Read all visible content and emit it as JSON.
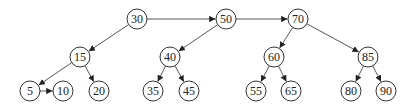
{
  "diagram": {
    "type": "skip-list-tree",
    "colors": {
      "stroke": "#333333",
      "fill": "#ffffff",
      "text": "#222222"
    },
    "node_radius": 10,
    "nodes": [
      {
        "id": "n30",
        "label": "30",
        "x": 137,
        "y": 19
      },
      {
        "id": "n50",
        "label": "50",
        "x": 226,
        "y": 19
      },
      {
        "id": "n70",
        "label": "70",
        "x": 298,
        "y": 19
      },
      {
        "id": "n15",
        "label": "15",
        "x": 80,
        "y": 57
      },
      {
        "id": "n40",
        "label": "40",
        "x": 170,
        "y": 57
      },
      {
        "id": "n60",
        "label": "60",
        "x": 274,
        "y": 57
      },
      {
        "id": "n85",
        "label": "85",
        "x": 368,
        "y": 57
      },
      {
        "id": "n5",
        "label": "5",
        "x": 30,
        "y": 91
      },
      {
        "id": "n10",
        "label": "10",
        "x": 63,
        "y": 91
      },
      {
        "id": "n20",
        "label": "20",
        "x": 99,
        "y": 91
      },
      {
        "id": "n35",
        "label": "35",
        "x": 153,
        "y": 91
      },
      {
        "id": "n45",
        "label": "45",
        "x": 189,
        "y": 91
      },
      {
        "id": "n55",
        "label": "55",
        "x": 256,
        "y": 91
      },
      {
        "id": "n65",
        "label": "65",
        "x": 291,
        "y": 91
      },
      {
        "id": "n80",
        "label": "80",
        "x": 351,
        "y": 91
      },
      {
        "id": "n90",
        "label": "90",
        "x": 386,
        "y": 91
      }
    ],
    "edges": [
      {
        "from": "n30",
        "to": "n50"
      },
      {
        "from": "n50",
        "to": "n70"
      },
      {
        "from": "n30",
        "to": "n15"
      },
      {
        "from": "n50",
        "to": "n40"
      },
      {
        "from": "n70",
        "to": "n60"
      },
      {
        "from": "n70",
        "to": "n85"
      },
      {
        "from": "n15",
        "to": "n5"
      },
      {
        "from": "n15",
        "to": "n20"
      },
      {
        "from": "n5",
        "to": "n10"
      },
      {
        "from": "n40",
        "to": "n35"
      },
      {
        "from": "n40",
        "to": "n45"
      },
      {
        "from": "n60",
        "to": "n55"
      },
      {
        "from": "n60",
        "to": "n65"
      },
      {
        "from": "n85",
        "to": "n80"
      },
      {
        "from": "n85",
        "to": "n90"
      }
    ]
  }
}
